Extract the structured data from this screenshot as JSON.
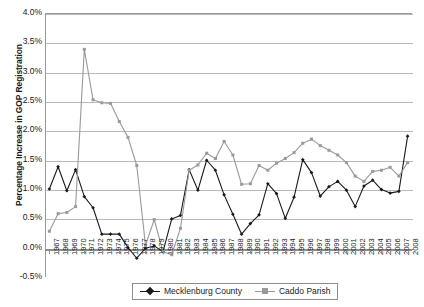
{
  "chart_data": {
    "type": "line",
    "title": "",
    "subtitle": "",
    "xlabel": "",
    "ylabel": "Percentage Increase in GOP Registration",
    "ylim": [
      -0.5,
      4.0
    ],
    "ytick_values": [
      4.0,
      3.5,
      3.0,
      2.5,
      2.0,
      1.5,
      1.0,
      0.5,
      0.0,
      -0.5
    ],
    "ytick_labels": [
      "4.0%",
      "3.5%",
      "3.0%",
      "2.5%",
      "2.0%",
      "1.5%",
      "1.0%",
      "0.5%",
      "0.0%",
      "-0.5%"
    ],
    "grid": true,
    "legend_position": "bottom",
    "categories": [
      "1967",
      "1968",
      "1969",
      "1970",
      "1971",
      "1972",
      "1973",
      "1974",
      "1975",
      "1976",
      "1977",
      "1978",
      "1979",
      "1980",
      "1981",
      "1982",
      "1983",
      "1984",
      "1985",
      "1986",
      "1987",
      "1988",
      "1989",
      "1990",
      "1991",
      "1992",
      "1993",
      "1994",
      "1995",
      "1996",
      "1997",
      "1998",
      "1999",
      "2000",
      "2001",
      "2002",
      "2003",
      "2004",
      "2005",
      "2006",
      "2007",
      "2008"
    ],
    "series": [
      {
        "name": "Mecklenburg County",
        "color": "#1a1a1a",
        "marker": "diamond",
        "values": [
          1.0,
          1.38,
          0.97,
          1.33,
          0.87,
          0.68,
          0.23,
          0.23,
          0.23,
          0.0,
          -0.18,
          -0.01,
          0.03,
          -0.07,
          0.49,
          0.55,
          1.33,
          0.98,
          1.49,
          1.32,
          0.9,
          0.57,
          0.23,
          0.41,
          0.56,
          1.09,
          0.92,
          0.5,
          0.86,
          1.5,
          1.28,
          0.88,
          1.04,
          1.13,
          0.98,
          0.7,
          1.05,
          1.15,
          0.99,
          0.93,
          0.96,
          1.9
        ]
      },
      {
        "name": "Caddo Parish",
        "color": "#9a9a9a",
        "marker": "square",
        "values": [
          0.28,
          0.58,
          0.6,
          0.7,
          3.38,
          2.52,
          2.47,
          2.46,
          2.15,
          1.88,
          1.4,
          0.04,
          0.48,
          -0.07,
          -0.12,
          0.33,
          1.32,
          1.41,
          1.61,
          1.52,
          1.81,
          1.58,
          1.08,
          1.09,
          1.4,
          1.32,
          1.44,
          1.52,
          1.62,
          1.78,
          1.85,
          1.74,
          1.66,
          1.58,
          1.45,
          1.22,
          1.13,
          1.3,
          1.32,
          1.37,
          1.22,
          1.45
        ]
      }
    ]
  },
  "legend": {
    "items": [
      {
        "label": "Mecklenburg County"
      },
      {
        "label": "Caddo Parish"
      }
    ]
  }
}
